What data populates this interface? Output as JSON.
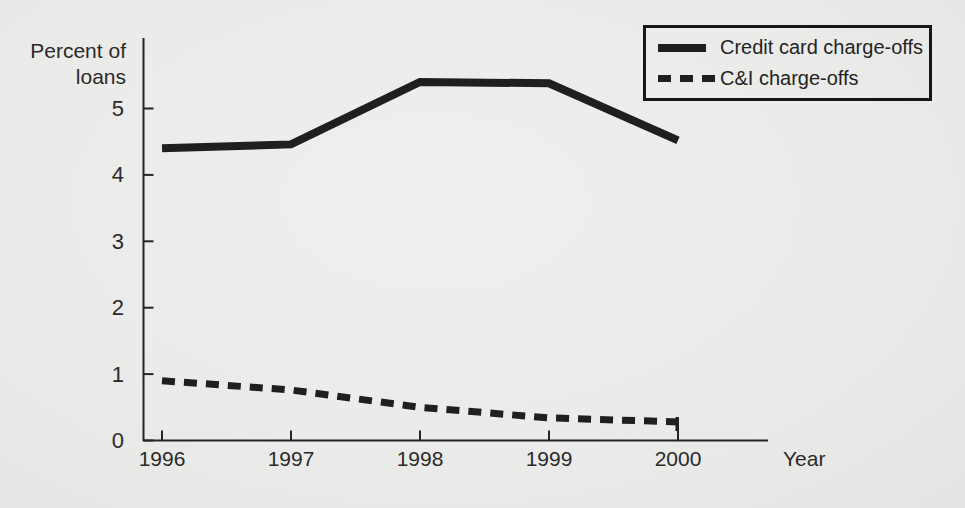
{
  "figure": {
    "ink_color": "#1f1f1f",
    "paper_color": "#ebebe9"
  },
  "chart_data": {
    "type": "line",
    "title": "",
    "xlabel": "Year",
    "ylabel": "Percent of loans",
    "ylabel_lines": [
      "Percent of",
      "loans"
    ],
    "x": [
      1996,
      1997,
      1998,
      1999,
      2000
    ],
    "x_tick_labels": [
      "1996",
      "1997",
      "1998",
      "1999",
      "2000"
    ],
    "y_ticks": [
      0,
      1,
      2,
      3,
      4,
      5
    ],
    "y_tick_labels": [
      "0",
      "1",
      "2",
      "3",
      "4",
      "5"
    ],
    "ylim": [
      0,
      6
    ],
    "grid": false,
    "legend_position": "top-right",
    "series": [
      {
        "name": "Credit card charge-offs",
        "style": "solid",
        "values": [
          4.4,
          4.46,
          5.4,
          5.38,
          4.52
        ]
      },
      {
        "name": "C&I charge-offs",
        "style": "dashed",
        "values": [
          0.9,
          0.76,
          0.5,
          0.34,
          0.28
        ]
      }
    ]
  }
}
